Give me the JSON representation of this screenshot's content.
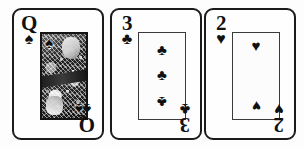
{
  "scene": {
    "title": "Three playing cards",
    "background_color": "#fdfdfd",
    "ink_color": "#111111"
  },
  "cards": [
    {
      "name": "queen-of-spades",
      "rank": "Q",
      "suit_name": "spades",
      "suit_glyph": "♠",
      "corner_top_left": {
        "rank": "Q",
        "pip": "♠"
      },
      "corner_bottom_right": {
        "rank": "Q",
        "pip": "♠"
      },
      "body": {
        "style": "court-illustration",
        "art_pip_top_left": "♠",
        "art_pip_bottom_right": "♠"
      }
    },
    {
      "name": "three-of-clubs",
      "rank": "3",
      "suit_name": "clubs",
      "suit_glyph": "♣",
      "corner_top_left": {
        "rank": "3",
        "pip": "♣"
      },
      "corner_bottom_right": {
        "rank": "3",
        "pip": "♣"
      },
      "body": {
        "style": "pip-column",
        "pip_count": 3,
        "pips": [
          "♣",
          "♣",
          "♣"
        ]
      }
    },
    {
      "name": "two-of-hearts",
      "rank": "2",
      "suit_name": "hearts",
      "suit_glyph": "♥",
      "corner_top_left": {
        "rank": "2",
        "pip": "♥"
      },
      "corner_bottom_right": {
        "rank": "2",
        "pip": "♥"
      },
      "body": {
        "style": "pip-column",
        "pip_count": 2,
        "pips": [
          "♥",
          "♥"
        ]
      }
    }
  ]
}
